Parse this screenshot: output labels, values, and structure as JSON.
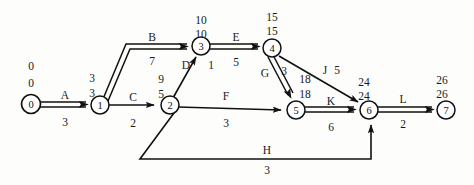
{
  "diagram": {
    "type": "aoa-cpm-network",
    "colors": {
      "line": "#111111",
      "node_fill": "#ffffff",
      "node_stroke": "#111111",
      "text": "#1a1a1a",
      "background": "#fdfdfb"
    },
    "nodes": [
      {
        "id": "0",
        "label": "0",
        "x": 31,
        "y": 104,
        "early": "0",
        "late": "0",
        "time_x": 31,
        "time_y_early": 66,
        "time_y_late": 83
      },
      {
        "id": "1",
        "label": "1",
        "x": 100,
        "y": 105,
        "early": "3",
        "late": "3",
        "time_x": 92,
        "time_y_early": 78,
        "time_y_late": 93
      },
      {
        "id": "2",
        "label": "2",
        "x": 170,
        "y": 105,
        "early": "9",
        "late": "5",
        "time_x": 161,
        "time_y_early": 79,
        "time_y_late": 94
      },
      {
        "id": "3",
        "label": "3",
        "x": 201,
        "y": 46,
        "early": "10",
        "late": "10",
        "time_x": 201,
        "time_y_early": 20,
        "time_y_late": 34
      },
      {
        "id": "4",
        "label": "4",
        "x": 272,
        "y": 48,
        "early": "15",
        "late": "15",
        "time_x": 272,
        "time_y_early": 17,
        "time_y_late": 31
      },
      {
        "id": "5",
        "label": "5",
        "x": 296,
        "y": 110,
        "early": "18",
        "late": "18",
        "time_x": 305,
        "time_y_early": 79,
        "time_y_late": 94
      },
      {
        "id": "6",
        "label": "6",
        "x": 369,
        "y": 110,
        "early": "24",
        "late": "24",
        "time_x": 364,
        "time_y_early": 82,
        "time_y_late": 96
      },
      {
        "id": "7",
        "label": "7",
        "x": 446,
        "y": 110,
        "early": "26",
        "late": "26",
        "time_x": 442,
        "time_y_early": 80,
        "time_y_late": 94
      }
    ],
    "edges": [
      {
        "id": "A",
        "label": "A",
        "duration": "3",
        "from": "0",
        "to": "1",
        "critical": true,
        "label_x": 65,
        "label_y": 95,
        "dur_x": 65,
        "dur_y": 122
      },
      {
        "id": "B",
        "label": "B",
        "duration": "7",
        "from": "1",
        "to": "3",
        "critical": true,
        "label_x": 152,
        "label_y": 37,
        "dur_x": 152,
        "dur_y": 61
      },
      {
        "id": "C",
        "label": "C",
        "duration": "2",
        "from": "1",
        "to": "2",
        "critical": false,
        "label_x": 133,
        "label_y": 97,
        "dur_x": 133,
        "dur_y": 123
      },
      {
        "id": "D",
        "label": "D",
        "duration": "1",
        "from": "2",
        "to": "3",
        "critical": false,
        "label_x": 186,
        "label_y": 65,
        "dur_x": 211,
        "dur_y": 65
      },
      {
        "id": "E",
        "label": "E",
        "duration": "5",
        "from": "3",
        "to": "4",
        "critical": true,
        "label_x": 236,
        "label_y": 37,
        "dur_x": 236,
        "dur_y": 62
      },
      {
        "id": "F",
        "label": "F",
        "duration": "3",
        "from": "2",
        "to": "5",
        "critical": false,
        "label_x": 226,
        "label_y": 96,
        "dur_x": 226,
        "dur_y": 123
      },
      {
        "id": "G",
        "label": "G",
        "duration": "3",
        "from": "4",
        "to": "5",
        "critical": true,
        "label_x": 265,
        "label_y": 73,
        "dur_x": 284,
        "dur_y": 71
      },
      {
        "id": "H",
        "label": "H",
        "duration": "3",
        "from": "2",
        "to": "6",
        "critical": false,
        "label_x": 267,
        "label_y": 150,
        "dur_x": 267,
        "dur_y": 170
      },
      {
        "id": "J",
        "label": "J",
        "duration": "5",
        "from": "4",
        "to": "6",
        "critical": false,
        "label_x": 325,
        "label_y": 70,
        "dur_x": 337,
        "dur_y": 70
      },
      {
        "id": "K",
        "label": "K",
        "duration": "6",
        "from": "5",
        "to": "6",
        "critical": true,
        "label_x": 331,
        "label_y": 101,
        "dur_x": 331,
        "dur_y": 127
      },
      {
        "id": "L",
        "label": "L",
        "duration": "2",
        "from": "6",
        "to": "7",
        "critical": true,
        "label_x": 403,
        "label_y": 99,
        "dur_x": 403,
        "dur_y": 124
      }
    ]
  }
}
